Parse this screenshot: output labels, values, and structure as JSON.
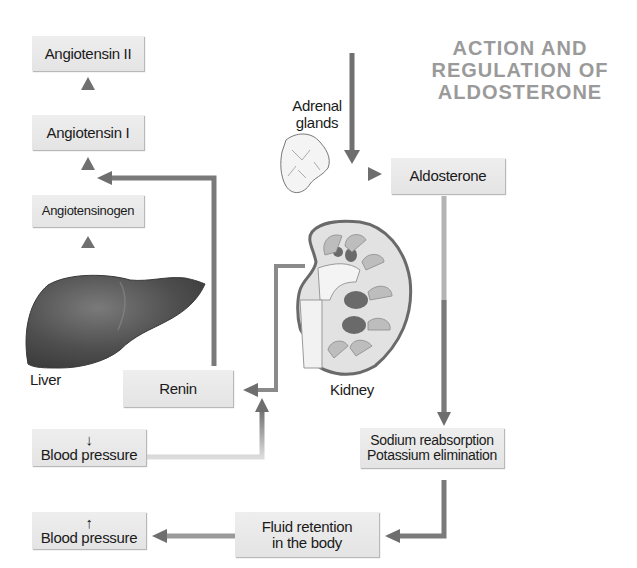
{
  "title": {
    "line1": "ACTION AND",
    "line2": "REGULATION OF",
    "line3": "ALDOSTERONE"
  },
  "nodes": {
    "angiotensin_ii": "Angiotensin II",
    "angiotensin_i": "Angiotensin I",
    "angiotensinogen": "Angiotensinogen",
    "renin": "Renin",
    "aldosterone": "Aldosterone",
    "blood_pressure_low": {
      "arrow": "↓",
      "label": "Blood pressure"
    },
    "blood_pressure_high": {
      "arrow": "↑",
      "label": "Blood pressure"
    },
    "sodium_potassium": {
      "line1": "Sodium reabsorption",
      "line2": "Potassium elimination"
    },
    "fluid_retention": {
      "line1": "Fluid retention",
      "line2": "in the body"
    }
  },
  "organs": {
    "liver": "Liver",
    "kidney": "Kidney",
    "adrenal": {
      "line1": "Adrenal",
      "line2": "glands"
    }
  },
  "colors": {
    "box_fill": "#e8e8e8",
    "arrow": "#6e6e6e",
    "title": "#9a9a9a"
  }
}
